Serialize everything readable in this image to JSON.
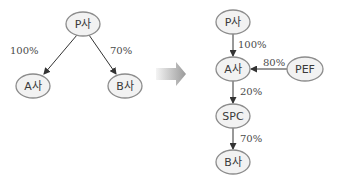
{
  "diagram": {
    "left": {
      "nodes": [
        {
          "id": "P",
          "label": "P사",
          "cx": 83,
          "cy": 24,
          "rx": 17,
          "ry": 12
        },
        {
          "id": "A",
          "label": "A사",
          "cx": 33,
          "cy": 86,
          "rx": 17,
          "ry": 12
        },
        {
          "id": "B",
          "label": "B사",
          "cx": 125,
          "cy": 86,
          "rx": 17,
          "ry": 12
        }
      ],
      "edges": [
        {
          "from": "P",
          "to": "A",
          "label": "100%"
        },
        {
          "from": "P",
          "to": "B",
          "label": "70%"
        }
      ]
    },
    "transition_arrow": {
      "icon": "right-arrow-icon",
      "color_start": "#f4f4f4",
      "color_end": "#9a9a9a"
    },
    "right": {
      "nodes": [
        {
          "id": "P",
          "label": "P사",
          "cx": 233,
          "cy": 22,
          "rx": 17,
          "ry": 12
        },
        {
          "id": "A",
          "label": "A사",
          "cx": 233,
          "cy": 69,
          "rx": 17,
          "ry": 12
        },
        {
          "id": "PEF",
          "label": "PEF",
          "cx": 305,
          "cy": 69,
          "rx": 18,
          "ry": 12
        },
        {
          "id": "SPC",
          "label": "SPC",
          "cx": 233,
          "cy": 116,
          "rx": 17,
          "ry": 12
        },
        {
          "id": "B",
          "label": "B사",
          "cx": 233,
          "cy": 162,
          "rx": 17,
          "ry": 12
        }
      ],
      "edges": [
        {
          "from": "P",
          "to": "A",
          "label": "100%"
        },
        {
          "from": "PEF",
          "to": "A",
          "label": "80%"
        },
        {
          "from": "A",
          "to": "SPC",
          "label": "20%"
        },
        {
          "from": "SPC",
          "to": "B",
          "label": "70%"
        }
      ]
    },
    "colors": {
      "node_fill": "#f2f2f2",
      "node_stroke": "#8c8c8c",
      "edge": "#333333",
      "text": "#3a3a3a"
    }
  }
}
